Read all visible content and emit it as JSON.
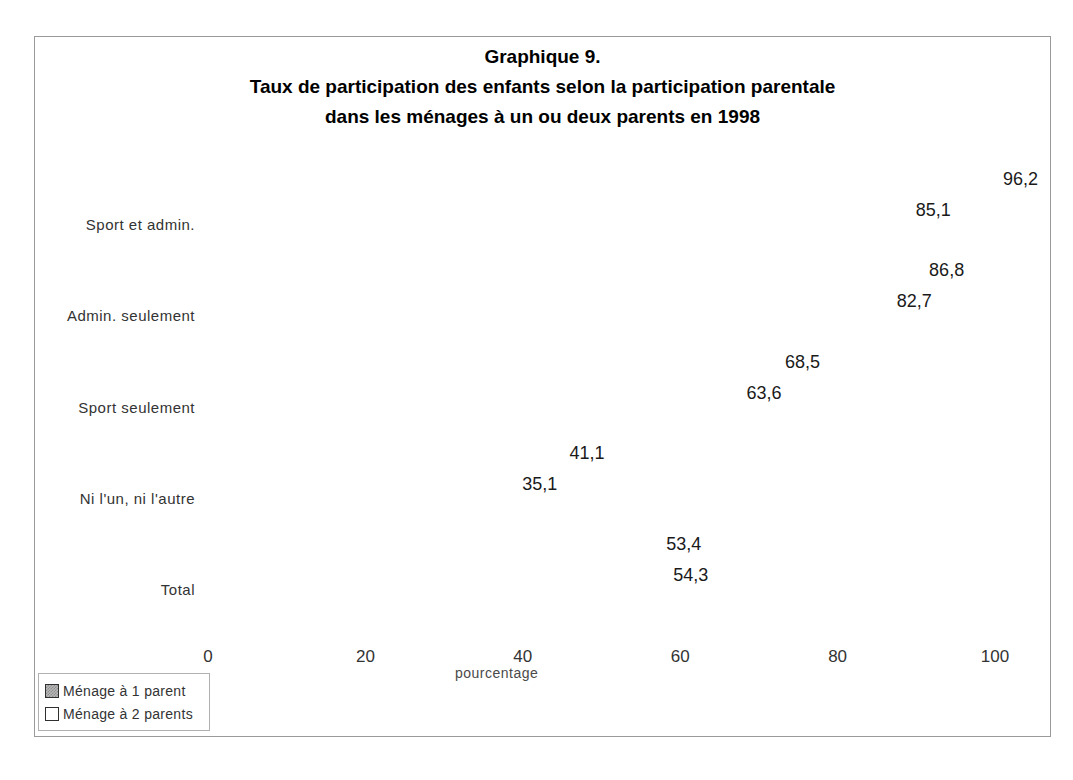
{
  "figure": {
    "title_line1": "Graphique 9.",
    "title_line2": "Taux de participation des enfants selon la participation parentale",
    "title_line3": "dans les ménages à un ou deux parents en 1998"
  },
  "chart_data": {
    "type": "bar",
    "orientation": "horizontal",
    "title": "Graphique 9. Taux de participation des enfants selon la participation parentale dans les ménages à un ou deux parents en 1998",
    "xlabel": "pourcentage",
    "ylabel": "",
    "xlim": [
      0,
      100
    ],
    "xticks": [
      "0",
      "20",
      "40",
      "60",
      "80",
      "100"
    ],
    "grid": true,
    "legend_position": "bottom-left",
    "style": "3d",
    "categories": [
      "Sport et admin.",
      "Admin. seulement",
      "Sport seulement",
      "Ni l'un, ni l'autre",
      "Total"
    ],
    "series": [
      {
        "name": "Ménage à 1 parent",
        "color": "#b9b9b9",
        "values": [
          96.2,
          86.8,
          68.5,
          41.1,
          53.4
        ],
        "labels": [
          "96,2",
          "86,8",
          "68,5",
          "41,1",
          "53,4"
        ]
      },
      {
        "name": "Ménage à 2 parents",
        "color": "#ffffff",
        "values": [
          85.1,
          82.7,
          63.6,
          35.1,
          54.3
        ],
        "labels": [
          "85,1",
          "82,7",
          "63,6",
          "35,1",
          "54,3"
        ]
      }
    ]
  },
  "legend": {
    "items": [
      {
        "label": "Ménage à 1 parent",
        "swatch": "gray"
      },
      {
        "label": "Ménage à 2 parents",
        "swatch": "white"
      }
    ]
  }
}
